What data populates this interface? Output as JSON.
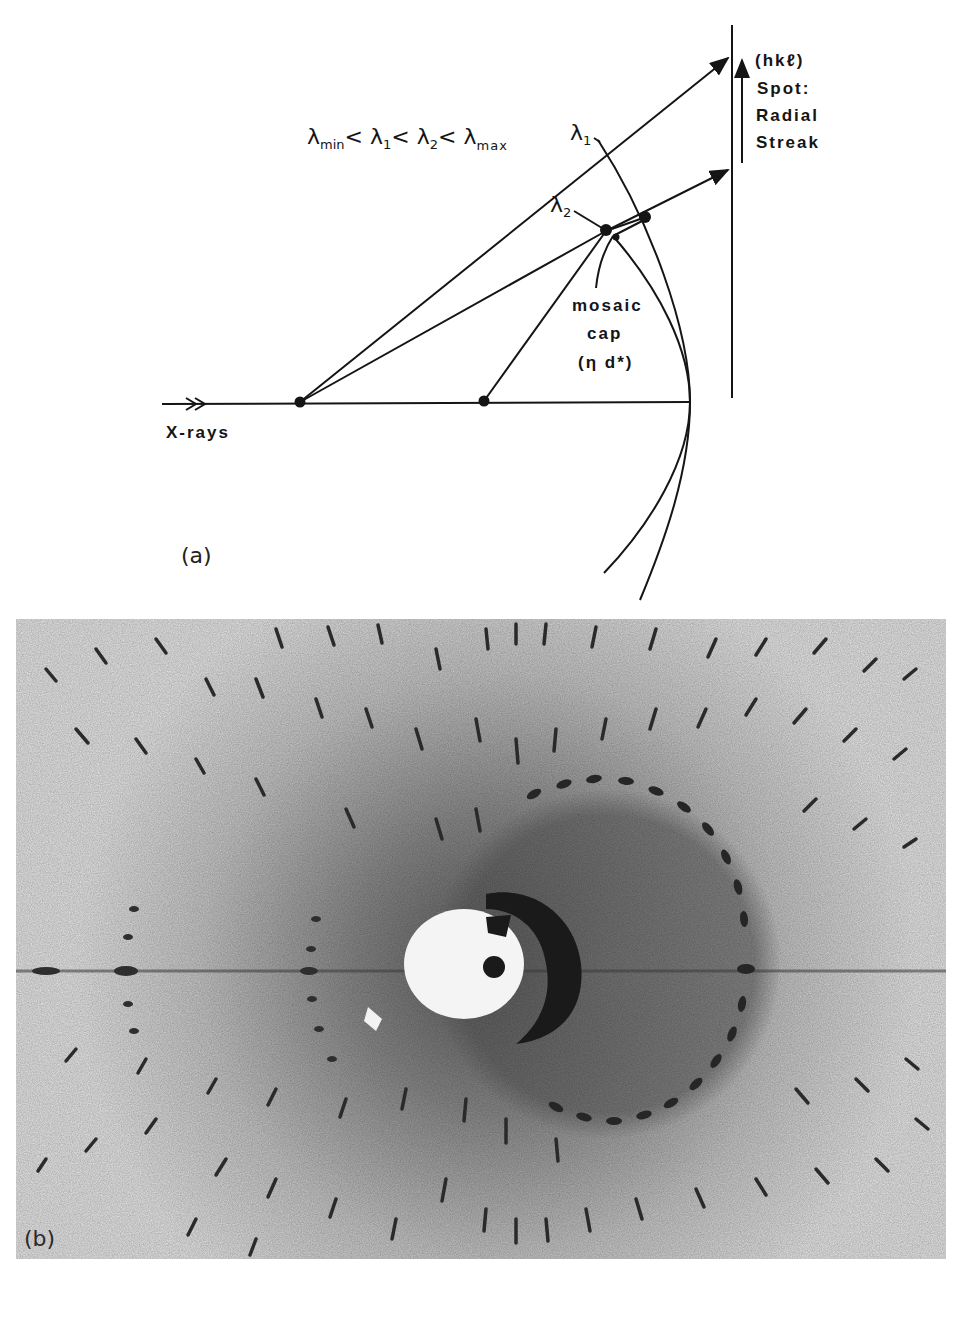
{
  "figure": {
    "panel_a": {
      "tag": "(a)",
      "inequality": {
        "lambda": "λ",
        "min_sub": "min",
        "lt": "<",
        "one_sub": "1",
        "two_sub": "2",
        "max_sub": "max"
      },
      "lambda1_label": "λ",
      "lambda1_sub": "1",
      "lambda2_label": "λ",
      "lambda2_sub": "2",
      "spot_label": {
        "line1": "(hkℓ)",
        "line2": "Spot:",
        "line3": "Radial",
        "line4": "Streak"
      },
      "mosaic_label": {
        "line1": "mosaic",
        "line2": "cap",
        "line3": "(η d*)"
      },
      "xray_label": "X-rays"
    },
    "panel_b": {
      "tag": "(b)",
      "description": "Laue diffraction photograph showing radially streaked spots"
    },
    "colors": {
      "ink": "#151515",
      "background": "#ffffff",
      "film_background": "#e9e9e9",
      "spot": "#2b2b2b"
    }
  }
}
